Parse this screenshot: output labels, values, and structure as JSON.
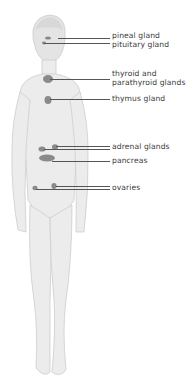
{
  "diagram": {
    "colors": {
      "body": "#e9e9e9",
      "outline": "#cfcfcf",
      "gland": "#8a8a8a",
      "leader": "#555555",
      "text": "#3a3a3a"
    },
    "labels": [
      {
        "id": "pineal",
        "text": "pineal gland",
        "top": 33,
        "line_y": 38,
        "line_x1": 58
      },
      {
        "id": "pituitary",
        "text": "pituitary gland",
        "top": 42,
        "line_y": 43,
        "line_x1": 44
      },
      {
        "id": "thyroid",
        "text": "thyroid and",
        "text2": "parathyroid glands",
        "top": 70,
        "line_y": 79,
        "line_x1": 50
      },
      {
        "id": "thymus",
        "text": "thymus gland",
        "top": 95,
        "line_y": 99,
        "line_x1": 50
      },
      {
        "id": "adrenal",
        "text": "adrenal glands",
        "top": 143,
        "line_y": 147,
        "line_x1": 56
      },
      {
        "id": "pancreas",
        "text": "pancreas",
        "top": 156,
        "line_y": 161,
        "line_x1": 50
      },
      {
        "id": "ovaries",
        "text": "ovaries",
        "top": 183,
        "line_y": 187,
        "line_x1": 36
      }
    ]
  }
}
